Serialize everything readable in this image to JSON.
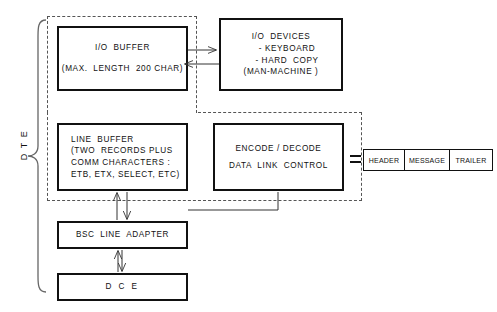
{
  "diagram": {
    "group_label": "D T E",
    "blocks": {
      "io_buffer": {
        "line1": "I/O  BUFFER",
        "line2": "(MAX.  LENGTH  200 CHAR)"
      },
      "io_devices": {
        "line1": "I/O  DEVICES",
        "line2": "- KEYBOARD",
        "line3": "- HARD  COPY",
        "line4": "(MAN-MACHINE )"
      },
      "line_buffer": {
        "line1": "LINE  BUFFER",
        "line2": "(TWO  RECORDS PLUS",
        "line3": "COMM CHARACTERS :",
        "line4": "ETB, ETX, SELECT, ETC)"
      },
      "encode_decode": {
        "line1": "ENCODE / DECODE",
        "line2": "DATA  LINK  CONTROL"
      },
      "bsc_line_adapter": {
        "line1": "BSC  LINE  ADAPTER"
      },
      "dce": {
        "line1": "D C E"
      }
    },
    "frame": {
      "cells": [
        {
          "label": "HEADER"
        },
        {
          "label": "MESSAGE"
        },
        {
          "label": "TRAILER"
        }
      ]
    },
    "colors": {
      "stroke": "#111111",
      "dashed": "#555555",
      "background": "#ffffff"
    }
  }
}
